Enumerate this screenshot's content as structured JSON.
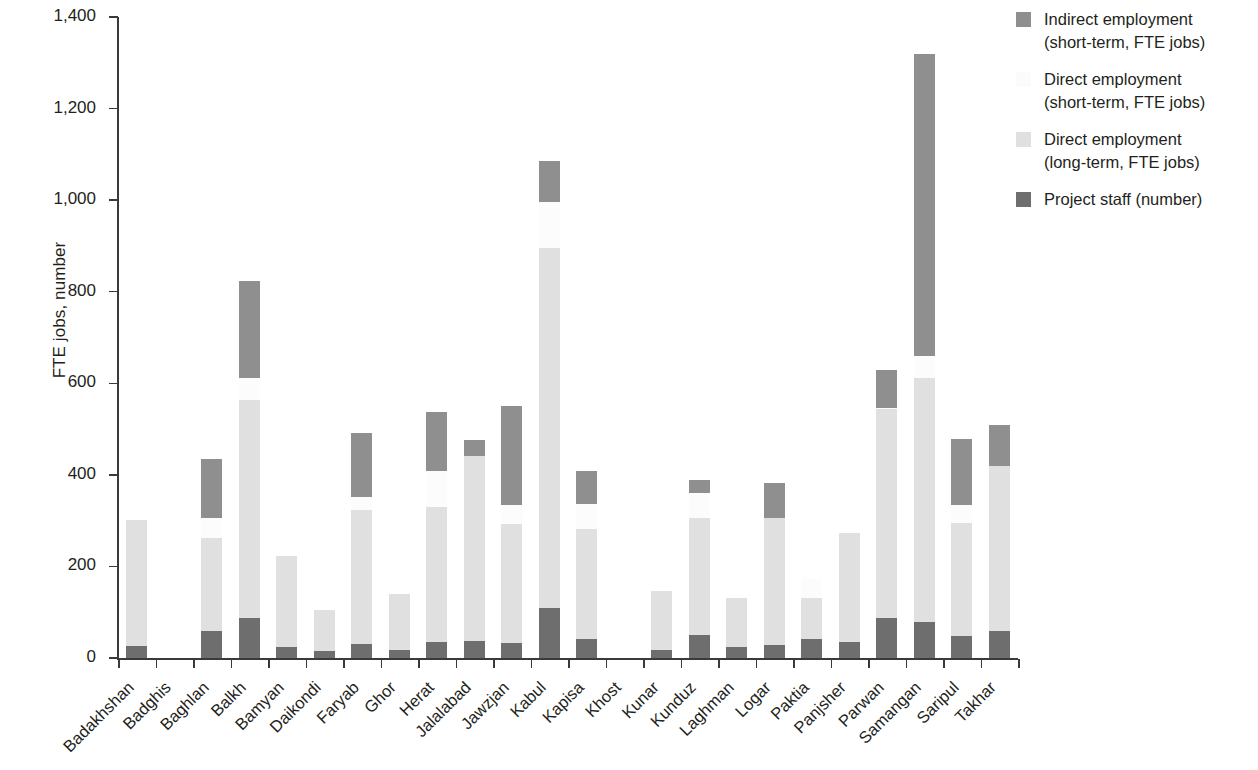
{
  "chart_data": {
    "type": "bar",
    "subtype": "stacked-bar",
    "title": "",
    "xlabel": "",
    "ylabel": "FTE jobs, number",
    "ylim": [
      0,
      1400
    ],
    "ytick_labels": [
      "0",
      "200",
      "400",
      "600",
      "800",
      "1,000",
      "1,200",
      "1,400"
    ],
    "ytick_values": [
      0,
      200,
      400,
      600,
      800,
      1000,
      1200,
      1400
    ],
    "grid": false,
    "legend_position": "top-right",
    "categories": [
      "Badakhshan",
      "Badghis",
      "Baghlan",
      "Balkh",
      "Bamyan",
      "Daikondi",
      "Faryab",
      "Ghor",
      "Herat",
      "Jalalabad",
      "Jawzjan",
      "Kabul",
      "Kapisa",
      "Khost",
      "Kunar",
      "Kunduz",
      "Laghman",
      "Logar",
      "Paktia",
      "Panjsher",
      "Parwan",
      "Samangan",
      "Saripul",
      "Takhar"
    ],
    "series": [
      {
        "name": "Project staff (number)",
        "color": "#6e6e6e",
        "values": [
          27,
          0,
          60,
          88,
          25,
          15,
          30,
          18,
          36,
          38,
          33,
          110,
          42,
          0,
          17,
          50,
          24,
          28,
          42,
          35,
          88,
          78,
          48,
          58
        ]
      },
      {
        "name": "Direct employment (long-term, FTE jobs)",
        "color": "#e0e0e0",
        "values": [
          275,
          0,
          203,
          475,
          198,
          90,
          293,
          122,
          294,
          403,
          260,
          785,
          240,
          0,
          130,
          255,
          106,
          278,
          90,
          238,
          455,
          533,
          246,
          362
        ]
      },
      {
        "name": "Direct employment (short-term, FTE jobs)",
        "color": "#fcfcfc",
        "values": [
          0,
          0,
          42,
          48,
          0,
          0,
          28,
          0,
          78,
          0,
          42,
          100,
          55,
          0,
          0,
          55,
          0,
          0,
          40,
          0,
          2,
          49,
          40,
          0
        ]
      },
      {
        "name": "Indirect employment (short-term, FTE jobs)",
        "color": "#8f8f8f",
        "values": [
          0,
          0,
          130,
          212,
          0,
          0,
          140,
          0,
          130,
          35,
          215,
          90,
          72,
          0,
          0,
          28,
          0,
          76,
          0,
          0,
          85,
          660,
          144,
          88
        ]
      }
    ],
    "stack_order_bottom_to_top": [
      "Project staff (number)",
      "Direct employment (long-term, FTE jobs)",
      "Direct employment (short-term, FTE jobs)",
      "Indirect employment (short-term, FTE jobs)"
    ],
    "bar_totals": [
      302,
      0,
      435,
      823,
      223,
      105,
      491,
      140,
      538,
      476,
      550,
      1085,
      409,
      0,
      147,
      388,
      130,
      382,
      172,
      273,
      630,
      1320,
      478,
      508
    ]
  },
  "legend": {
    "items": [
      {
        "label": "Indirect employment\n(short-term, FTE jobs)",
        "line1": "Indirect employment",
        "line2": "(short-term, FTE jobs)",
        "color": "#8f8f8f",
        "icon": "legend-swatch-icon"
      },
      {
        "label": "Direct employment\n(short-term, FTE jobs)",
        "line1": "Direct employment",
        "line2": "(short-term, FTE jobs)",
        "color": "#fcfcfc",
        "icon": "legend-swatch-icon"
      },
      {
        "label": "Direct employment\n(long-term, FTE jobs)",
        "line1": "Direct employment",
        "line2": "(long-term, FTE jobs)",
        "color": "#e0e0e0",
        "icon": "legend-swatch-icon"
      },
      {
        "label": "Project staff (number)",
        "line1": "Project staff (number)",
        "line2": "",
        "color": "#6e6e6e",
        "icon": "legend-swatch-icon"
      }
    ]
  },
  "axis": {
    "y_title": "FTE jobs, number"
  },
  "colors": {
    "axis": "#3a3a3a",
    "text": "#231f20",
    "indirect": "#8f8f8f",
    "direct_short": "#fcfcfc",
    "direct_long": "#e0e0e0",
    "project_staff": "#6e6e6e"
  }
}
